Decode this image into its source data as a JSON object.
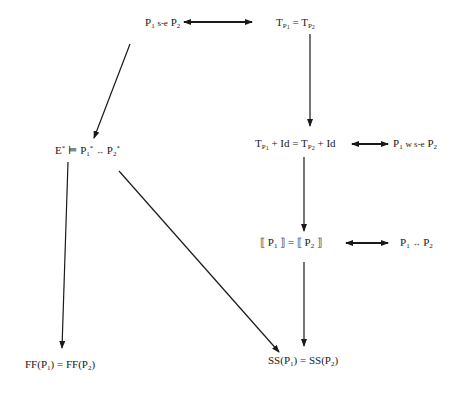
{
  "diagram": {
    "type": "implication-diagram",
    "nodes": [
      {
        "id": "strong-equiv",
        "label": "P1 s-e P2",
        "x": 145,
        "y": 16
      },
      {
        "id": "trans-equal",
        "label": "T_P1 = T_P2",
        "x": 276,
        "y": 16
      },
      {
        "id": "trans-id-equal",
        "label": "T_P1 + Id = T_P2 + Id",
        "x": 255,
        "y": 137
      },
      {
        "id": "weak-strong-equiv",
        "label": "P1 w s-e P2",
        "x": 393,
        "y": 137
      },
      {
        "id": "ext-entails",
        "label": "E* ⊨ P1* ↔ P2*",
        "x": 55,
        "y": 144
      },
      {
        "id": "denot-equal",
        "label": "⟦P1⟧ = ⟦P2⟧",
        "x": 260,
        "y": 236
      },
      {
        "id": "logical-equiv",
        "label": "P1 ↔ P2",
        "x": 400,
        "y": 236
      },
      {
        "id": "ff-equal",
        "label": "FF(P1) = FF(P2)",
        "x": 25,
        "y": 358
      },
      {
        "id": "ss-equal",
        "label": "SS(P1) = SS(P2)",
        "x": 268,
        "y": 354
      }
    ],
    "edges": [
      {
        "from": "strong-equiv",
        "to": "trans-equal",
        "kind": "bidirectional"
      },
      {
        "from": "strong-equiv",
        "to": "ext-entails",
        "kind": "implies"
      },
      {
        "from": "trans-equal",
        "to": "trans-id-equal",
        "kind": "implies"
      },
      {
        "from": "trans-id-equal",
        "to": "weak-strong-equiv",
        "kind": "bidirectional"
      },
      {
        "from": "trans-id-equal",
        "to": "denot-equal",
        "kind": "implies"
      },
      {
        "from": "denot-equal",
        "to": "logical-equiv",
        "kind": "bidirectional"
      },
      {
        "from": "denot-equal",
        "to": "ss-equal",
        "kind": "implies"
      },
      {
        "from": "ext-entails",
        "to": "ff-equal",
        "kind": "implies"
      },
      {
        "from": "ext-entails",
        "to": "ss-equal",
        "kind": "implies"
      }
    ],
    "text": {
      "P": "P",
      "one": "1",
      "two": "2",
      "se": "s-e",
      "wse": "w s-e",
      "T": "T",
      "eq": "=",
      "plus_id": "+ Id",
      "E": "E",
      "star": "*",
      "models": "⊨",
      "iff": "↔",
      "lbr": "⟦",
      "rbr": "⟧",
      "FF": "FF",
      "SS": "SS",
      "lp": "(",
      "rp": ")"
    },
    "colors": {
      "stroke": "#1a1a1a",
      "background": "#ffffff"
    }
  }
}
